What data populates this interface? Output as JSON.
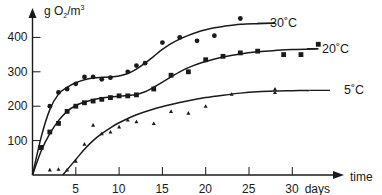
{
  "chart_data": {
    "type": "scatter",
    "title": "",
    "xlabel": "time",
    "xunit": "days",
    "ylabel": "g O2/m3",
    "xlim": [
      0,
      34
    ],
    "ylim": [
      0,
      460
    ],
    "xticks": [
      5,
      10,
      15,
      20,
      25,
      30
    ],
    "xtick_labels": [
      "5",
      "10",
      "15",
      "20",
      "25",
      "30 days"
    ],
    "yticks": [
      100,
      200,
      300,
      400
    ],
    "ytick_labels": [
      "100",
      "200",
      "300",
      "400"
    ],
    "grid": false,
    "legend": "inline labels at curve ends",
    "series": [
      {
        "name": "30°C",
        "label": "30˚C",
        "marker": "circle",
        "points": [
          [
            1,
            80
          ],
          [
            2,
            200
          ],
          [
            3,
            240
          ],
          [
            4,
            250
          ],
          [
            5,
            265
          ],
          [
            6,
            285
          ],
          [
            7,
            285
          ],
          [
            8,
            278
          ],
          [
            9,
            283
          ],
          [
            11,
            300
          ],
          [
            12,
            318
          ],
          [
            13,
            325
          ],
          [
            15,
            385
          ],
          [
            17,
            400
          ],
          [
            19,
            390
          ],
          [
            21,
            405
          ],
          [
            24,
            455
          ]
        ],
        "curve": [
          [
            0,
            0
          ],
          [
            1,
            110
          ],
          [
            2,
            190
          ],
          [
            3,
            235
          ],
          [
            4,
            255
          ],
          [
            5,
            268
          ],
          [
            6,
            277
          ],
          [
            7,
            282
          ],
          [
            8,
            284
          ],
          [
            9,
            285
          ],
          [
            10,
            288
          ],
          [
            11,
            295
          ],
          [
            12,
            308
          ],
          [
            13,
            325
          ],
          [
            14,
            345
          ],
          [
            15,
            365
          ],
          [
            16,
            382
          ],
          [
            17,
            395
          ],
          [
            18,
            406
          ],
          [
            19,
            415
          ],
          [
            20,
            422
          ],
          [
            21,
            428
          ],
          [
            22,
            432
          ],
          [
            24,
            438
          ],
          [
            26,
            440
          ],
          [
            28,
            441
          ]
        ]
      },
      {
        "name": "20°C",
        "label": "20˚C",
        "marker": "square",
        "points": [
          [
            1,
            80
          ],
          [
            2,
            125
          ],
          [
            3,
            150
          ],
          [
            4,
            185
          ],
          [
            5,
            200
          ],
          [
            6,
            210
          ],
          [
            7,
            215
          ],
          [
            8,
            220
          ],
          [
            9,
            225
          ],
          [
            10,
            230
          ],
          [
            11,
            230
          ],
          [
            12,
            233
          ],
          [
            14,
            250
          ],
          [
            16,
            290
          ],
          [
            18,
            300
          ],
          [
            20,
            335
          ],
          [
            22,
            345
          ],
          [
            24,
            355
          ],
          [
            26,
            360
          ],
          [
            29,
            350
          ],
          [
            31,
            350
          ],
          [
            33,
            380
          ]
        ],
        "curve": [
          [
            0,
            0
          ],
          [
            1,
            70
          ],
          [
            2,
            120
          ],
          [
            3,
            158
          ],
          [
            4,
            185
          ],
          [
            5,
            202
          ],
          [
            6,
            212
          ],
          [
            7,
            219
          ],
          [
            8,
            224
          ],
          [
            9,
            227
          ],
          [
            10,
            229
          ],
          [
            11,
            231
          ],
          [
            12,
            234
          ],
          [
            13,
            242
          ],
          [
            14,
            255
          ],
          [
            15,
            270
          ],
          [
            16,
            285
          ],
          [
            17,
            300
          ],
          [
            18,
            312
          ],
          [
            19,
            322
          ],
          [
            20,
            330
          ],
          [
            22,
            343
          ],
          [
            24,
            352
          ],
          [
            26,
            358
          ],
          [
            28,
            362
          ],
          [
            30,
            365
          ],
          [
            33,
            367
          ]
        ]
      },
      {
        "name": "5°C",
        "label": "5˚C",
        "marker": "triangle",
        "points": [
          [
            2,
            15
          ],
          [
            3,
            17
          ],
          [
            4,
            15
          ],
          [
            5,
            40
          ],
          [
            6,
            90
          ],
          [
            7,
            145
          ],
          [
            8,
            120
          ],
          [
            9,
            125
          ],
          [
            10,
            140
          ],
          [
            11,
            160
          ],
          [
            12,
            155
          ],
          [
            14,
            150
          ],
          [
            16,
            185
          ],
          [
            18,
            180
          ],
          [
            20,
            200
          ],
          [
            23,
            235
          ],
          [
            28,
            250
          ],
          [
            28,
            240
          ]
        ],
        "curve": [
          [
            3.5,
            0
          ],
          [
            5,
            45
          ],
          [
            6,
            75
          ],
          [
            7,
            100
          ],
          [
            8,
            120
          ],
          [
            9,
            137
          ],
          [
            10,
            152
          ],
          [
            12,
            175
          ],
          [
            14,
            192
          ],
          [
            16,
            205
          ],
          [
            18,
            216
          ],
          [
            20,
            225
          ],
          [
            22,
            232
          ],
          [
            24,
            238
          ],
          [
            26,
            242
          ],
          [
            28,
            244
          ],
          [
            30,
            245
          ],
          [
            32,
            246
          ]
        ]
      }
    ]
  },
  "axes": {
    "y_title": "g O",
    "y_title_sub": "2",
    "y_title_unit": "/m",
    "y_title_sup": "3",
    "x_title": "time",
    "x_unit_label": "days"
  },
  "colors": {
    "ink": "#1a1a1a",
    "background": "#ffffff"
  }
}
